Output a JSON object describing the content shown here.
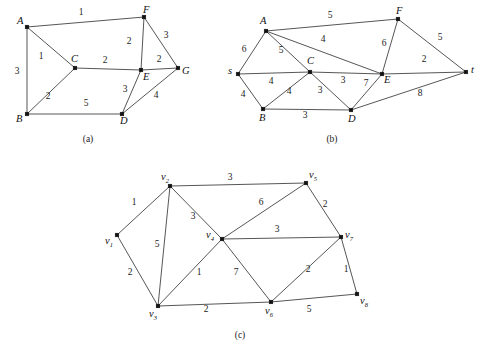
{
  "figure": {
    "width": 486,
    "height": 356,
    "background": "#ffffff",
    "line_color": "#2b2b2b",
    "node_color": "#111111",
    "text_color": "#1a1a1a"
  },
  "panels": [
    {
      "id": "panel-a",
      "caption": "(a)",
      "caption_pos": [
        88,
        142
      ],
      "nodes": [
        {
          "name": "A",
          "label": "A",
          "x": 27,
          "y": 27,
          "lx": 17,
          "ly": 24
        },
        {
          "name": "B",
          "label": "B",
          "x": 27,
          "y": 114,
          "lx": 16,
          "ly": 122
        },
        {
          "name": "C",
          "label": "C",
          "x": 75,
          "y": 68,
          "lx": 71,
          "ly": 62
        },
        {
          "name": "D",
          "label": "D",
          "x": 122,
          "y": 114,
          "lx": 120,
          "ly": 124
        },
        {
          "name": "E",
          "label": "E",
          "x": 141,
          "y": 70,
          "lx": 143,
          "ly": 80
        },
        {
          "name": "F",
          "label": "F",
          "x": 144,
          "y": 17,
          "lx": 143,
          "ly": 13
        },
        {
          "name": "G",
          "label": "G",
          "x": 178,
          "y": 68,
          "lx": 182,
          "ly": 74
        }
      ],
      "edges": [
        {
          "from": "A",
          "to": "F",
          "weight": "1",
          "wx": 81,
          "wy": 15
        },
        {
          "from": "A",
          "to": "B",
          "weight": "3",
          "wx": 17,
          "wy": 74
        },
        {
          "from": "A",
          "to": "C",
          "weight": "1",
          "wx": 41,
          "wy": 59
        },
        {
          "from": "B",
          "to": "C",
          "weight": "2",
          "wx": 48,
          "wy": 99
        },
        {
          "from": "B",
          "to": "D",
          "weight": "5",
          "wx": 86,
          "wy": 106
        },
        {
          "from": "C",
          "to": "E",
          "weight": "2",
          "wx": 105,
          "wy": 63
        },
        {
          "from": "F",
          "to": "E",
          "weight": "2",
          "wx": 129,
          "wy": 44
        },
        {
          "from": "F",
          "to": "G",
          "weight": "3",
          "wx": 166,
          "wy": 38
        },
        {
          "from": "E",
          "to": "G",
          "weight": "2",
          "wx": 159,
          "wy": 62
        },
        {
          "from": "E",
          "to": "D",
          "weight": "3",
          "wx": 125,
          "wy": 92
        },
        {
          "from": "D",
          "to": "G",
          "weight": "4",
          "wx": 156,
          "wy": 98
        }
      ]
    },
    {
      "id": "panel-b",
      "caption": "(b)",
      "caption_pos": [
        332,
        142
      ],
      "nodes": [
        {
          "name": "s",
          "label": "s",
          "x": 238,
          "y": 74,
          "lx": 228,
          "ly": 74
        },
        {
          "name": "A",
          "label": "A",
          "x": 266,
          "y": 31,
          "lx": 260,
          "ly": 24
        },
        {
          "name": "B",
          "label": "B",
          "x": 263,
          "y": 109,
          "lx": 259,
          "ly": 121
        },
        {
          "name": "C",
          "label": "C",
          "x": 310,
          "y": 72,
          "lx": 307,
          "ly": 64
        },
        {
          "name": "D",
          "label": "D",
          "x": 351,
          "y": 110,
          "lx": 348,
          "ly": 122
        },
        {
          "name": "E",
          "label": "E",
          "x": 382,
          "y": 74,
          "lx": 384,
          "ly": 83
        },
        {
          "name": "F",
          "label": "F",
          "x": 398,
          "y": 19,
          "lx": 396,
          "ly": 14
        },
        {
          "name": "t",
          "label": "t",
          "x": 466,
          "y": 72,
          "lx": 471,
          "ly": 73
        }
      ],
      "edges": [
        {
          "from": "A",
          "to": "F",
          "weight": "5",
          "wx": 330,
          "wy": 18
        },
        {
          "from": "s",
          "to": "A",
          "weight": "6",
          "wx": 244,
          "wy": 52
        },
        {
          "from": "A",
          "to": "C",
          "weight": "5",
          "wx": 281,
          "wy": 53
        },
        {
          "from": "A",
          "to": "E",
          "weight": "4",
          "wx": 323,
          "wy": 42
        },
        {
          "from": "s",
          "to": "C",
          "weight": "4",
          "wx": 271,
          "wy": 84
        },
        {
          "from": "s",
          "to": "B",
          "weight": "4",
          "wx": 243,
          "wy": 97
        },
        {
          "from": "B",
          "to": "C",
          "weight": "4",
          "wx": 289,
          "wy": 94
        },
        {
          "from": "B",
          "to": "D",
          "weight": "3",
          "wx": 305,
          "wy": 118
        },
        {
          "from": "C",
          "to": "D",
          "weight": "3",
          "wx": 320,
          "wy": 93
        },
        {
          "from": "C",
          "to": "E",
          "weight": "3",
          "wx": 343,
          "wy": 83
        },
        {
          "from": "D",
          "to": "E",
          "weight": "7",
          "wx": 366,
          "wy": 86
        },
        {
          "from": "F",
          "to": "E",
          "weight": "6",
          "wx": 384,
          "wy": 46
        },
        {
          "from": "F",
          "to": "t",
          "weight": "5",
          "wx": 440,
          "wy": 40
        },
        {
          "from": "E",
          "to": "t",
          "weight": "2",
          "wx": 424,
          "wy": 62
        },
        {
          "from": "D",
          "to": "t",
          "weight": "8",
          "wx": 420,
          "wy": 96
        }
      ]
    },
    {
      "id": "panel-c",
      "caption": "(c)",
      "caption_pos": [
        240,
        338
      ],
      "nodes": [
        {
          "name": "v1",
          "label": "v",
          "sub": "1",
          "x": 117,
          "y": 235,
          "lx": 105,
          "ly": 244
        },
        {
          "name": "v2",
          "label": "v",
          "sub": "2",
          "x": 170,
          "y": 186,
          "lx": 161,
          "ly": 180
        },
        {
          "name": "v3",
          "label": "v",
          "sub": "3",
          "x": 158,
          "y": 306,
          "lx": 149,
          "ly": 317
        },
        {
          "name": "v4",
          "label": "v",
          "sub": "4",
          "x": 222,
          "y": 239,
          "lx": 206,
          "ly": 238
        },
        {
          "name": "v5",
          "label": "v",
          "sub": "5",
          "x": 306,
          "y": 183,
          "lx": 309,
          "ly": 178
        },
        {
          "name": "v6",
          "label": "v",
          "sub": "6",
          "x": 271,
          "y": 302,
          "lx": 265,
          "ly": 314
        },
        {
          "name": "v7",
          "label": "v",
          "sub": "7",
          "x": 341,
          "y": 237,
          "lx": 345,
          "ly": 238
        },
        {
          "name": "v8",
          "label": "v",
          "sub": "8",
          "x": 357,
          "y": 294,
          "lx": 360,
          "ly": 304
        }
      ],
      "edges": [
        {
          "from": "v2",
          "to": "v5",
          "weight": "3",
          "wx": 230,
          "wy": 180
        },
        {
          "from": "v1",
          "to": "v2",
          "weight": "1",
          "wx": 134,
          "wy": 205
        },
        {
          "from": "v2",
          "to": "v3",
          "weight": "5",
          "wx": 157,
          "wy": 247
        },
        {
          "from": "v2",
          "to": "v4",
          "weight": "3",
          "wx": 193,
          "wy": 219
        },
        {
          "from": "v1",
          "to": "v3",
          "weight": "2",
          "wx": 130,
          "wy": 275
        },
        {
          "from": "v3",
          "to": "v4",
          "weight": "1",
          "wx": 199,
          "wy": 275
        },
        {
          "from": "v3",
          "to": "v6",
          "weight": "2",
          "wx": 206,
          "wy": 312
        },
        {
          "from": "v4",
          "to": "v5",
          "weight": "6",
          "wx": 261,
          "wy": 205
        },
        {
          "from": "v4",
          "to": "v7",
          "weight": "3",
          "wx": 277,
          "wy": 232
        },
        {
          "from": "v4",
          "to": "v6",
          "weight": "7",
          "wx": 236,
          "wy": 275
        },
        {
          "from": "v5",
          "to": "v7",
          "weight": "2",
          "wx": 325,
          "wy": 207
        },
        {
          "from": "v6",
          "to": "v7",
          "weight": "2",
          "wx": 308,
          "wy": 272
        },
        {
          "from": "v6",
          "to": "v8",
          "weight": "5",
          "wx": 309,
          "wy": 312
        },
        {
          "from": "v7",
          "to": "v8",
          "weight": "1",
          "wx": 346,
          "wy": 272
        }
      ]
    }
  ]
}
